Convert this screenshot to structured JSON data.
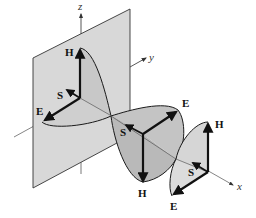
{
  "figure": {
    "axes": {
      "x": "x",
      "y": "y",
      "z": "z"
    },
    "vectors": {
      "electric": "E",
      "magnetic": "H",
      "poynting": "S"
    },
    "wavefronts": [
      {
        "position": "origin",
        "E_label": "E",
        "H_label": "H",
        "S_label": "S",
        "H_direction": "up",
        "E_direction": "toward-viewer-left"
      },
      {
        "position": "half-wavelength",
        "E_label": "E",
        "H_label": "H",
        "S_label": "S",
        "H_direction": "down",
        "E_direction": "away-right"
      },
      {
        "position": "wavelength",
        "E_label": "E",
        "H_label": "H",
        "S_label": "S",
        "H_direction": "up",
        "E_direction": "toward-viewer-left"
      }
    ],
    "colors": {
      "plane_fill": "#d6d6d6",
      "lobe_fill": "#c2c2c2",
      "lobe_fill_light": "#d9d9d9",
      "stroke": "#1a1a1a",
      "axis": "#555555"
    }
  }
}
